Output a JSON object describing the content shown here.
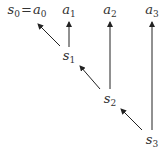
{
  "diagram": {
    "type": "directed-graph",
    "nodes": [
      {
        "id": "s0a0",
        "base": "s",
        "sub": "0",
        "eq": "=",
        "base2": "a",
        "sub2": "0",
        "x": 27,
        "y": 11
      },
      {
        "id": "a1",
        "base": "a",
        "sub": "1",
        "x": 69,
        "y": 11
      },
      {
        "id": "a2",
        "base": "a",
        "sub": "2",
        "x": 110,
        "y": 11
      },
      {
        "id": "a3",
        "base": "a",
        "sub": "3",
        "x": 152,
        "y": 11
      },
      {
        "id": "s1",
        "base": "s",
        "sub": "1",
        "x": 69,
        "y": 57
      },
      {
        "id": "s2",
        "base": "s",
        "sub": "2",
        "x": 110,
        "y": 100
      },
      {
        "id": "s3",
        "base": "s",
        "sub": "3",
        "x": 152,
        "y": 141
      }
    ],
    "edges": [
      {
        "from": "s1",
        "to": "s0a0"
      },
      {
        "from": "s1",
        "to": "a1"
      },
      {
        "from": "s2",
        "to": "s1"
      },
      {
        "from": "s2",
        "to": "a2"
      },
      {
        "from": "s3",
        "to": "s2"
      },
      {
        "from": "s3",
        "to": "a3"
      }
    ],
    "edge_color": "#222222"
  }
}
